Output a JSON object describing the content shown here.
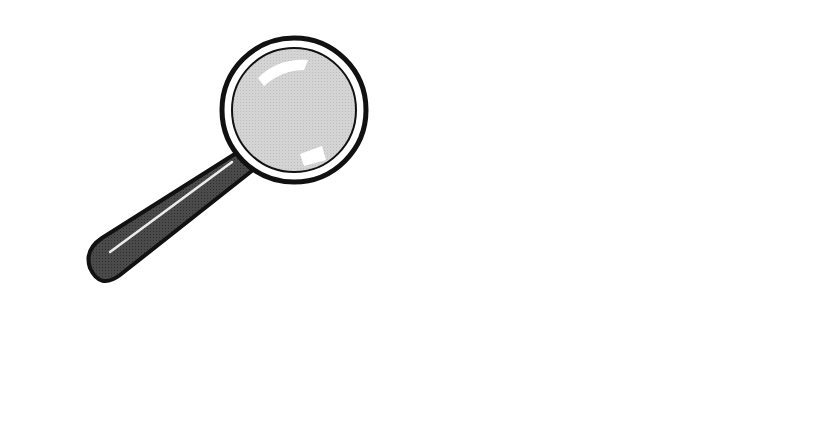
{
  "top_number_line": {
    "y": 107,
    "x_start": 32,
    "x_end": 636,
    "ticks": [
      {
        "x": 110,
        "label": "1"
      },
      {
        "x": 183,
        "label": "2"
      },
      {
        "x": 257,
        "label": "3"
      },
      {
        "x": 330,
        "label": "4"
      },
      {
        "x": 405,
        "label": "5"
      },
      {
        "x": 478,
        "label": "6"
      },
      {
        "x": 552,
        "label": "7"
      }
    ]
  },
  "bottom_number_line": {
    "y": 368,
    "x_start": 150,
    "x_end": 797,
    "ticks": [
      {
        "x": 207,
        "label": "3.0"
      },
      {
        "x": 259.5,
        "label": "3.1"
      },
      {
        "x": 312,
        "label": "3.2"
      },
      {
        "x": 364.5,
        "label": "3.3"
      },
      {
        "x": 417,
        "label": "3.4"
      },
      {
        "x": 469.5,
        "label": "3.5"
      },
      {
        "x": 522,
        "label": "3.6"
      },
      {
        "x": 574.5,
        "label": "3.7"
      },
      {
        "x": 627,
        "label": "3.8"
      },
      {
        "x": 679.5,
        "label": "3.9"
      },
      {
        "x": 732,
        "label": "4.0"
      }
    ]
  },
  "magnifier": {
    "center_x": 294,
    "center_y": 110,
    "outer_radius": 72,
    "inner_radius": 62,
    "lens_color": "#d2d2d2",
    "handle_color": "#4a4a4a"
  },
  "zoom_lines": [
    {
      "from": [
        257,
        107
      ],
      "to": [
        207,
        368
      ]
    },
    {
      "from": [
        330,
        107
      ],
      "to": [
        732,
        368
      ]
    }
  ]
}
